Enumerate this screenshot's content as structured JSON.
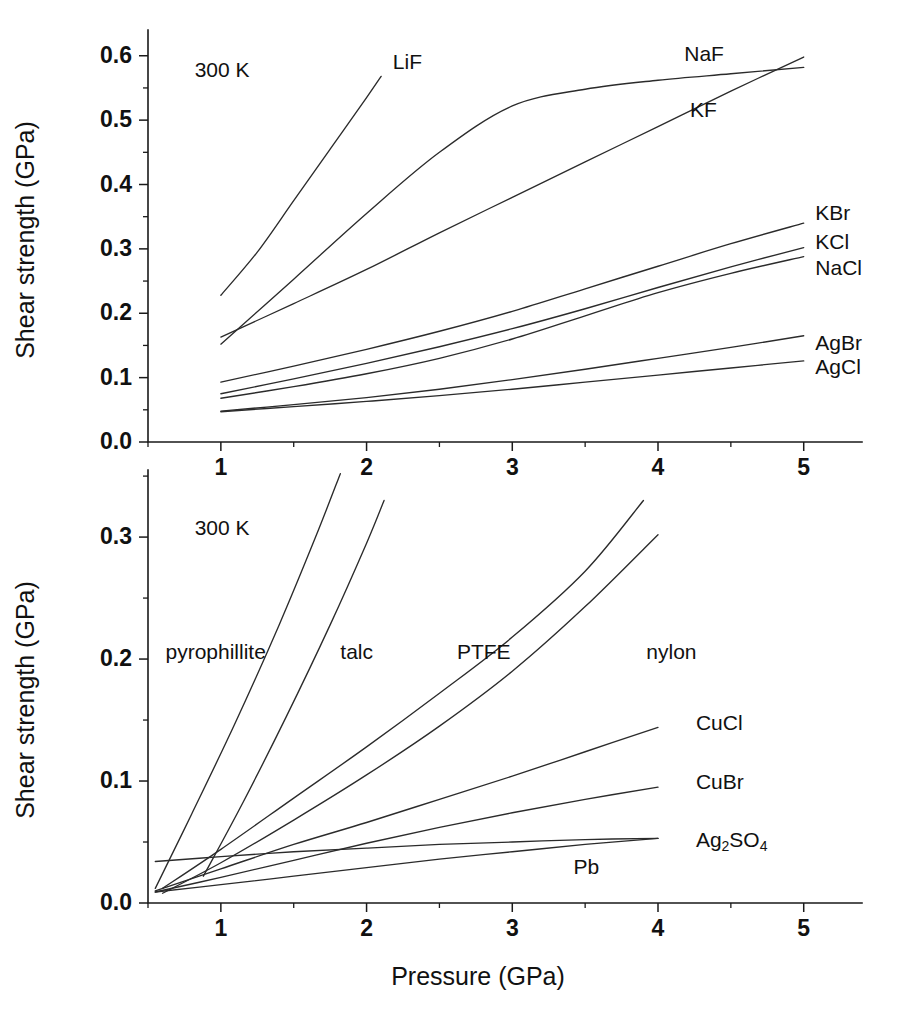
{
  "figure": {
    "axis_titles": {
      "x": "Pressure (GPa)",
      "y": "Shear strength (GPa)"
    }
  },
  "chart_data": [
    {
      "type": "line",
      "panel": "top",
      "title": "",
      "xlabel": "Pressure (GPa)",
      "ylabel": "Shear strength (GPa)",
      "xlim": [
        0.5,
        5.4
      ],
      "ylim": [
        0.0,
        0.64
      ],
      "grid": false,
      "legend_position": "inline-labels",
      "annotations": [
        {
          "text": "300 K",
          "x": 0.82,
          "y": 0.575
        }
      ],
      "xticks": [
        1,
        2,
        3,
        4,
        5
      ],
      "xticklabels": [
        "1",
        "2",
        "3",
        "4",
        "5"
      ],
      "xticks_minor": [
        0.5,
        1.5,
        2.5,
        3.5,
        4.5
      ],
      "yticks": [
        0.0,
        0.1,
        0.2,
        0.3,
        0.4,
        0.5,
        0.6
      ],
      "yticklabels": [
        "0.0",
        "0.1",
        "0.2",
        "0.3",
        "0.4",
        "0.5",
        "0.6"
      ],
      "yticks_minor": [
        0.05,
        0.15,
        0.25,
        0.35,
        0.45,
        0.55
      ],
      "series": [
        {
          "name": "LiF",
          "label": "LiF",
          "label_x": 2.18,
          "label_y": 0.588,
          "x": [
            1.0,
            1.25,
            1.5,
            1.75,
            2.0,
            2.1
          ],
          "y": [
            0.228,
            0.295,
            0.375,
            0.455,
            0.535,
            0.568
          ]
        },
        {
          "name": "NaF",
          "label": "NaF",
          "label_x": 4.18,
          "label_y": 0.6,
          "x": [
            1.0,
            1.5,
            2.0,
            2.5,
            3.0,
            3.5,
            4.0,
            4.5,
            5.0
          ],
          "y": [
            0.152,
            0.253,
            0.355,
            0.45,
            0.522,
            0.548,
            0.562,
            0.572,
            0.582
          ]
        },
        {
          "name": "KF",
          "label": "KF",
          "label_x": 4.22,
          "label_y": 0.514,
          "x": [
            1.0,
            1.5,
            2.0,
            2.5,
            3.0,
            3.5,
            4.0,
            4.5,
            5.0
          ],
          "y": [
            0.163,
            0.215,
            0.268,
            0.325,
            0.38,
            0.435,
            0.49,
            0.545,
            0.598
          ]
        },
        {
          "name": "KBr",
          "label": "KBr",
          "label_x": 5.08,
          "label_y": 0.354,
          "x": [
            1.0,
            1.5,
            2.0,
            2.5,
            3.0,
            3.5,
            4.0,
            4.5,
            5.0
          ],
          "y": [
            0.093,
            0.118,
            0.144,
            0.172,
            0.203,
            0.238,
            0.273,
            0.308,
            0.34
          ]
        },
        {
          "name": "KCl",
          "label": "KCl",
          "label_x": 5.08,
          "label_y": 0.308,
          "x": [
            1.0,
            1.5,
            2.0,
            2.5,
            3.0,
            3.5,
            4.0,
            4.5,
            5.0
          ],
          "y": [
            0.075,
            0.098,
            0.122,
            0.148,
            0.176,
            0.207,
            0.24,
            0.272,
            0.302
          ]
        },
        {
          "name": "NaCl",
          "label": "NaCl",
          "label_x": 5.08,
          "label_y": 0.268,
          "x": [
            1.0,
            1.5,
            2.0,
            2.5,
            3.0,
            3.5,
            4.0,
            4.5,
            5.0
          ],
          "y": [
            0.068,
            0.086,
            0.106,
            0.13,
            0.16,
            0.196,
            0.232,
            0.262,
            0.288
          ]
        },
        {
          "name": "AgBr",
          "label": "AgBr",
          "label_x": 5.08,
          "label_y": 0.152,
          "x": [
            1.0,
            1.5,
            2.0,
            2.5,
            3.0,
            3.5,
            4.0,
            4.5,
            5.0
          ],
          "y": [
            0.048,
            0.058,
            0.069,
            0.082,
            0.097,
            0.113,
            0.13,
            0.147,
            0.165
          ]
        },
        {
          "name": "AgCl",
          "label": "AgCl",
          "label_x": 5.08,
          "label_y": 0.114,
          "x": [
            1.0,
            1.5,
            2.0,
            2.5,
            3.0,
            3.5,
            4.0,
            4.5,
            5.0
          ],
          "y": [
            0.047,
            0.055,
            0.063,
            0.072,
            0.082,
            0.093,
            0.104,
            0.115,
            0.126
          ]
        }
      ]
    },
    {
      "type": "line",
      "panel": "bottom",
      "title": "",
      "xlabel": "Pressure (GPa)",
      "ylabel": "Shear strength (GPa)",
      "xlim": [
        0.5,
        5.4
      ],
      "ylim": [
        0.0,
        0.355
      ],
      "grid": false,
      "legend_position": "inline-labels",
      "annotations": [
        {
          "text": "300 K",
          "x": 0.82,
          "y": 0.306
        }
      ],
      "xticks": [
        1,
        2,
        3,
        4,
        5
      ],
      "xticklabels": [
        "1",
        "2",
        "3",
        "4",
        "5"
      ],
      "xticks_minor": [
        0.5,
        1.5,
        2.5,
        3.5,
        4.5
      ],
      "yticks": [
        0.0,
        0.1,
        0.2,
        0.3
      ],
      "yticklabels": [
        "0.0",
        "0.1",
        "0.2",
        "0.3"
      ],
      "yticks_minor": [
        0.05,
        0.15,
        0.25,
        0.35
      ],
      "series": [
        {
          "name": "pyrophillite",
          "label": "pyrophillite",
          "label_x": 0.62,
          "label_y": 0.205,
          "x": [
            0.55,
            0.8,
            1.1,
            1.4,
            1.65,
            1.82
          ],
          "y": [
            0.012,
            0.073,
            0.148,
            0.228,
            0.3,
            0.352
          ]
        },
        {
          "name": "talc",
          "label": "talc",
          "label_x": 1.82,
          "label_y": 0.205,
          "x": [
            0.88,
            1.15,
            1.45,
            1.75,
            2.0,
            2.12
          ],
          "y": [
            0.022,
            0.082,
            0.153,
            0.228,
            0.295,
            0.33
          ]
        },
        {
          "name": "PTFE",
          "label": "PTFE",
          "label_x": 2.62,
          "label_y": 0.205,
          "x": [
            0.6,
            1.0,
            1.5,
            2.0,
            2.5,
            3.0,
            3.5,
            3.9
          ],
          "y": [
            0.012,
            0.044,
            0.086,
            0.128,
            0.172,
            0.218,
            0.272,
            0.33
          ]
        },
        {
          "name": "nylon",
          "label": "nylon",
          "label_x": 3.92,
          "label_y": 0.205,
          "x": [
            0.6,
            1.0,
            1.5,
            2.0,
            2.5,
            3.0,
            3.5,
            4.0
          ],
          "y": [
            0.008,
            0.033,
            0.068,
            0.105,
            0.145,
            0.19,
            0.243,
            0.302
          ]
        },
        {
          "name": "CuCl",
          "label": "CuCl",
          "label_x": 4.26,
          "label_y": 0.146,
          "x": [
            0.55,
            1.0,
            1.5,
            2.0,
            2.5,
            3.0,
            3.5,
            4.0
          ],
          "y": [
            0.01,
            0.028,
            0.048,
            0.066,
            0.085,
            0.104,
            0.124,
            0.144
          ]
        },
        {
          "name": "CuBr",
          "label": "CuBr",
          "label_x": 4.26,
          "label_y": 0.098,
          "x": [
            0.55,
            1.0,
            1.5,
            2.0,
            2.5,
            3.0,
            3.5,
            4.0
          ],
          "y": [
            0.009,
            0.021,
            0.035,
            0.049,
            0.062,
            0.074,
            0.085,
            0.095
          ]
        },
        {
          "name": "Ag2SO4",
          "label": "Ag2SO4",
          "label_html": "Ag<sub>2</sub>SO<sub>4</sub>",
          "label_x": 4.26,
          "label_y": 0.051,
          "x": [
            0.55,
            1.0,
            1.5,
            2.0,
            2.5,
            3.0,
            3.5,
            4.0
          ],
          "y": [
            0.034,
            0.038,
            0.042,
            0.045,
            0.048,
            0.05,
            0.052,
            0.053
          ]
        },
        {
          "name": "Pb",
          "label": "Pb",
          "label_x": 3.42,
          "label_y": 0.028,
          "x": [
            0.55,
            1.0,
            1.5,
            2.0,
            2.5,
            3.0,
            3.5,
            4.0
          ],
          "y": [
            0.009,
            0.015,
            0.022,
            0.029,
            0.036,
            0.042,
            0.048,
            0.053
          ]
        }
      ]
    }
  ]
}
